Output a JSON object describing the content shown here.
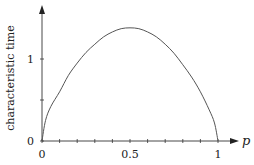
{
  "chart_data": {
    "type": "line",
    "title": "",
    "xlabel": "p",
    "ylabel": "characteristic time",
    "xlim": [
      0,
      1
    ],
    "ylim": [
      0,
      1.55
    ],
    "x_ticks": [
      0,
      0.1,
      0.2,
      0.3,
      0.4,
      0.5,
      0.6,
      0.7,
      0.8,
      0.9,
      1
    ],
    "x_tick_labels": {
      "0": "0",
      "0.5": "0.5",
      "1": "1"
    },
    "y_ticks": [
      0,
      0.5,
      1
    ],
    "y_tick_labels": {
      "0": "0",
      "1": "1"
    },
    "grid": false,
    "legend": null,
    "series": [
      {
        "name": "characteristic time",
        "x": [
          0,
          0.02,
          0.05,
          0.1,
          0.15,
          0.2,
          0.25,
          0.3,
          0.35,
          0.4,
          0.45,
          0.5,
          0.55,
          0.6,
          0.65,
          0.7,
          0.75,
          0.8,
          0.85,
          0.9,
          0.95,
          0.98,
          1
        ],
        "values": [
          0,
          0.25,
          0.42,
          0.6,
          0.8,
          0.95,
          1.08,
          1.18,
          1.27,
          1.33,
          1.37,
          1.38,
          1.37,
          1.33,
          1.27,
          1.18,
          1.07,
          0.93,
          0.78,
          0.6,
          0.38,
          0.22,
          0
        ]
      }
    ]
  }
}
